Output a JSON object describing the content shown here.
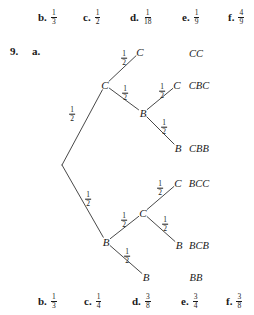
{
  "answers_top": {
    "items": [
      {
        "letter": "b.",
        "num": "1",
        "den": "3",
        "x": 38
      },
      {
        "letter": "c.",
        "num": "1",
        "den": "2",
        "x": 83
      },
      {
        "letter": "d.",
        "num": "1",
        "den": "18",
        "x": 130
      },
      {
        "letter": "e.",
        "num": "1",
        "den": "9",
        "x": 182
      },
      {
        "letter": "f.",
        "num": "4",
        "den": "9",
        "x": 228
      }
    ]
  },
  "answers_bottom": {
    "items": [
      {
        "letter": "b.",
        "num": "1",
        "den": "3",
        "x": 38
      },
      {
        "letter": "c.",
        "num": "1",
        "den": "4",
        "x": 84
      },
      {
        "letter": "d.",
        "num": "3",
        "den": "8",
        "x": 132
      },
      {
        "letter": "e.",
        "num": "3",
        "den": "4",
        "x": 181
      },
      {
        "letter": "f.",
        "num": "3",
        "den": "8",
        "x": 226
      }
    ]
  },
  "problem": {
    "number": "9.",
    "part": "a."
  },
  "chart_data": {
    "type": "tree",
    "root": {
      "x": 62,
      "y": 165
    },
    "nodes": [
      {
        "id": "root",
        "label": "",
        "x": 62,
        "y": 165
      },
      {
        "id": "c1",
        "label": "C",
        "x": 105,
        "y": 85
      },
      {
        "id": "b1",
        "label": "B",
        "x": 106,
        "y": 242
      },
      {
        "id": "c2",
        "label": "C",
        "x": 140,
        "y": 52
      },
      {
        "id": "b2",
        "label": "B",
        "x": 143,
        "y": 113
      },
      {
        "id": "c3",
        "label": "C",
        "x": 143,
        "y": 213
      },
      {
        "id": "b3",
        "label": "B",
        "x": 146,
        "y": 277
      },
      {
        "id": "c4",
        "label": "C",
        "x": 177,
        "y": 85
      },
      {
        "id": "b4",
        "label": "B",
        "x": 178,
        "y": 148
      },
      {
        "id": "c5",
        "label": "C",
        "x": 178,
        "y": 183
      },
      {
        "id": "b5",
        "label": "B",
        "x": 179,
        "y": 245
      }
    ],
    "edges": [
      {
        "from": "root",
        "to": "c1",
        "prob": {
          "num": "1",
          "den": "2"
        },
        "label_x": 72,
        "label_y": 113
      },
      {
        "from": "root",
        "to": "b1",
        "prob": {
          "num": "1",
          "den": "2"
        },
        "label_x": 88,
        "label_y": 198
      },
      {
        "from": "c1",
        "to": "c2",
        "prob": {
          "num": "1",
          "den": "2"
        },
        "label_x": 124,
        "label_y": 57
      },
      {
        "from": "c1",
        "to": "b2",
        "prob": {
          "num": "1",
          "den": "2"
        },
        "label_x": 125,
        "label_y": 92
      },
      {
        "from": "b2",
        "to": "c4",
        "prob": {
          "num": "1",
          "den": "2"
        },
        "label_x": 162,
        "label_y": 90
      },
      {
        "from": "b2",
        "to": "b4",
        "prob": {
          "num": "1",
          "den": "2"
        },
        "label_x": 164,
        "label_y": 126
      },
      {
        "from": "b1",
        "to": "c3",
        "prob": {
          "num": "1",
          "den": "2"
        },
        "label_x": 124,
        "label_y": 219
      },
      {
        "from": "b1",
        "to": "b3",
        "prob": {
          "num": "1",
          "den": "2"
        },
        "label_x": 127,
        "label_y": 255
      },
      {
        "from": "c3",
        "to": "c5",
        "prob": {
          "num": "1",
          "den": "2"
        },
        "label_x": 160,
        "label_y": 187
      },
      {
        "from": "c3",
        "to": "b5",
        "prob": {
          "num": "1",
          "den": "2"
        },
        "label_x": 165,
        "label_y": 223
      }
    ],
    "outcomes": [
      {
        "label": "CC",
        "x": 196,
        "y": 53,
        "probability": 0.25
      },
      {
        "label": "CBC",
        "x": 199,
        "y": 85,
        "probability": 0.25
      },
      {
        "label": "CBB",
        "x": 199,
        "y": 148,
        "probability": 0.25
      },
      {
        "label": "BCC",
        "x": 199,
        "y": 183,
        "probability": 0.25
      },
      {
        "label": "BCB",
        "x": 199,
        "y": 245,
        "probability": 0.25
      },
      {
        "label": "BB",
        "x": 196,
        "y": 277,
        "probability": 0.25
      }
    ],
    "colors": {
      "stroke": "#333333",
      "text": "#1a1a1a",
      "background": "#ffffff"
    }
  }
}
